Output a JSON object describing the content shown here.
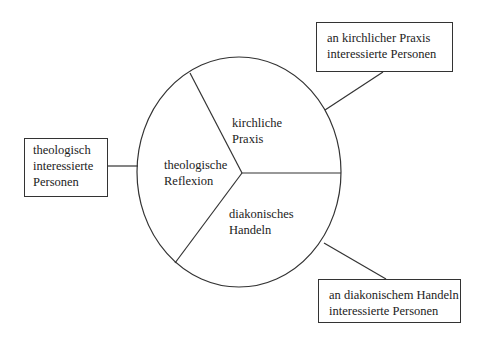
{
  "diagram": {
    "segments": {
      "top_right": {
        "line1": "kirchliche",
        "line2": "Praxis"
      },
      "left": {
        "line1": "theologische",
        "line2": "Reflexion"
      },
      "bottom_right": {
        "line1": "diakonisches",
        "line2": "Handeln"
      }
    },
    "boxes": {
      "top_right": {
        "line1": "an kirchlicher Praxis",
        "line2": "interessierte Personen"
      },
      "left": {
        "line1": "theologisch",
        "line2": "interessierte",
        "line3": "Personen"
      },
      "bottom_right": {
        "line1": "an diakonischem Handeln",
        "line2": "interessierte Personen"
      }
    },
    "colors": {
      "stroke": "#333333",
      "text": "#222222"
    }
  }
}
